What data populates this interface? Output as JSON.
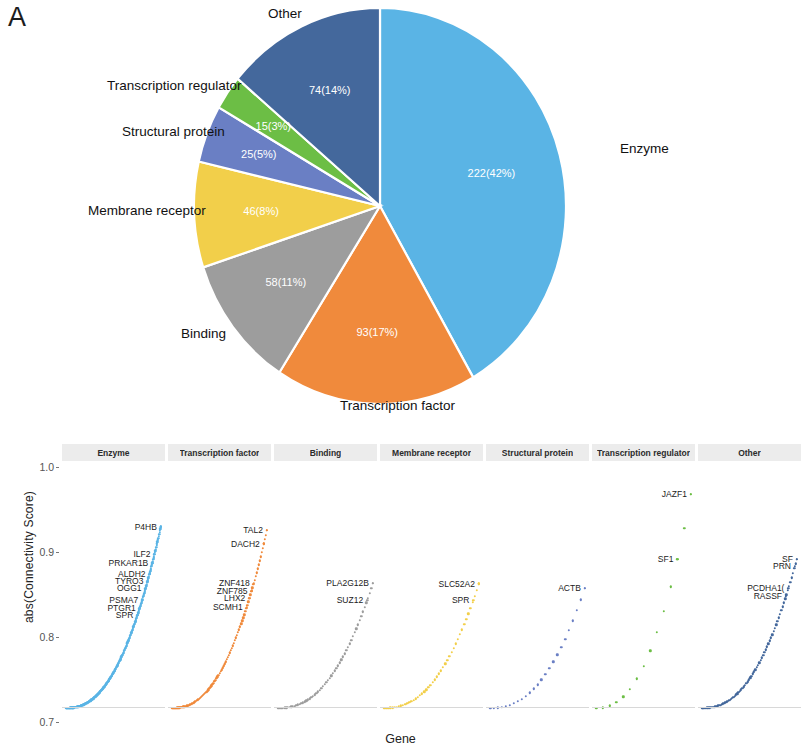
{
  "figure": {
    "panel_a_letter": "A",
    "panel_b_letter": "B"
  },
  "chart_data": [
    {
      "type": "pie",
      "title": "",
      "legend_position": "outside-labels",
      "categories": [
        "Enzyme",
        "Transcription factor",
        "Binding",
        "Membrane receptor",
        "Structural protein",
        "Transcription regulator",
        "Other"
      ],
      "values": [
        222,
        93,
        58,
        46,
        25,
        15,
        74
      ],
      "percents": [
        42,
        17,
        11,
        8,
        5,
        3,
        14
      ],
      "slice_labels": [
        "222(42%)",
        "93(17%)",
        "58(11%)",
        "46(8%)",
        "25(5%)",
        "15(3%)",
        "74(14%)"
      ],
      "colors": [
        "#5ab4e5",
        "#f08a3c",
        "#9d9d9d",
        "#f2cf4a",
        "#6a7fc4",
        "#6cbe45",
        "#44689c"
      ],
      "start_angle_deg": 0,
      "direction": "clockwise"
    },
    {
      "type": "scatter",
      "title": "",
      "xlabel": "Gene",
      "ylabel": "abs(Connectivity Score)",
      "ylim": [
        0.7,
        1.02
      ],
      "yticks": [
        "1.0",
        "0.9",
        "0.8",
        "0.7"
      ],
      "ytick_values": [
        1.0,
        0.9,
        0.8,
        0.7
      ],
      "grid": false,
      "facets": [
        {
          "name": "Enzyme",
          "color": "#5ab4e5",
          "n_points": 222,
          "labels": [
            {
              "gene": "P4HB",
              "y": 0.935
            },
            {
              "gene": "ILF2",
              "y": 0.899
            },
            {
              "gene": "PRKAR1B",
              "y": 0.888
            },
            {
              "gene": "ALDH2",
              "y": 0.874
            },
            {
              "gene": "TYRO3",
              "y": 0.864
            },
            {
              "gene": "OGG1",
              "y": 0.855
            },
            {
              "gene": "PSMA7",
              "y": 0.84
            },
            {
              "gene": "PTGR1",
              "y": 0.83
            },
            {
              "gene": "SPR",
              "y": 0.82
            }
          ]
        },
        {
          "name": "Transcription factor",
          "color": "#f08a3c",
          "n_points": 93,
          "labels": [
            {
              "gene": "TAL2",
              "y": 0.93
            },
            {
              "gene": "DACH2",
              "y": 0.913
            },
            {
              "gene": "ZNF418",
              "y": 0.862
            },
            {
              "gene": "ZNF785",
              "y": 0.852
            },
            {
              "gene": "LHX2",
              "y": 0.842
            },
            {
              "gene": "SCMH1",
              "y": 0.831
            }
          ]
        },
        {
          "name": "Binding",
          "color": "#9d9d9d",
          "n_points": 58,
          "labels": [
            {
              "gene": "PLA2G12B",
              "y": 0.862
            },
            {
              "gene": "SUZ12",
              "y": 0.84
            }
          ]
        },
        {
          "name": "Membrane receptor",
          "color": "#f2cf4a",
          "n_points": 46,
          "labels": [
            {
              "gene": "SLC52A2",
              "y": 0.861
            },
            {
              "gene": "SPR",
              "y": 0.84
            }
          ]
        },
        {
          "name": "Structural protein",
          "color": "#6a7fc4",
          "n_points": 25,
          "labels": [
            {
              "gene": "ACTB",
              "y": 0.855
            }
          ]
        },
        {
          "name": "Transcription regulator",
          "color": "#6cbe45",
          "n_points": 15,
          "labels": [
            {
              "gene": "JAZF1",
              "y": 0.977
            },
            {
              "gene": "SF1",
              "y": 0.893
            }
          ]
        },
        {
          "name": "Other",
          "color": "#44689c",
          "n_points": 74,
          "labels": [
            {
              "gene": "SF",
              "y": 0.893
            },
            {
              "gene": "PRN",
              "y": 0.884
            },
            {
              "gene": "PCDHA1(",
              "y": 0.855
            },
            {
              "gene": "RASSF",
              "y": 0.845
            }
          ]
        }
      ]
    }
  ]
}
